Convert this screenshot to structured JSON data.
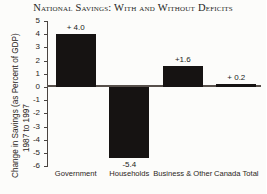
{
  "chart_data": {
    "type": "bar",
    "title": "National Savings: With and Without Deficits",
    "xlabel": "",
    "ylabel": "Change in Savings (as Percent of GDP)",
    "ylabel_line2": "1987 to 1997",
    "categories": [
      "Government",
      "Households",
      "Business & Other",
      "Canada Total"
    ],
    "values": [
      4.0,
      -5.4,
      1.6,
      0.2
    ],
    "value_labels": [
      "+ 4.0",
      "-5.4",
      "+1.6",
      "+ 0.2"
    ],
    "ylim": [
      -6,
      5
    ],
    "ytick_values": [
      5,
      4,
      3,
      2,
      1,
      0,
      -1,
      -2,
      -3,
      -4,
      -5,
      -6
    ],
    "ytick_labels": [
      "5",
      "4",
      "3",
      "2",
      "1",
      "0",
      "-1",
      "-2",
      "-3",
      "-4",
      "-5",
      "-6"
    ],
    "grid": false,
    "legend": "none",
    "bar_color": "#161312",
    "axis_color": "#4a4440",
    "background": "#fcfcfa"
  }
}
